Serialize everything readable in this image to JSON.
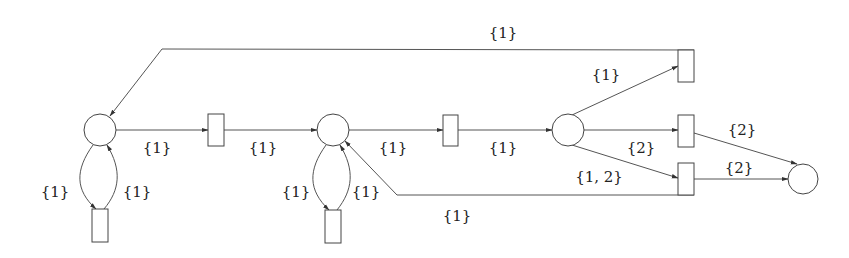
{
  "diagram": {
    "type": "petri-net",
    "places": [
      {
        "id": "p1",
        "cx": 100,
        "cy": 130,
        "r": 16
      },
      {
        "id": "p2",
        "cx": 333,
        "cy": 130,
        "r": 16
      },
      {
        "id": "p3",
        "cx": 568,
        "cy": 130,
        "r": 16
      },
      {
        "id": "p4",
        "cx": 803,
        "cy": 179,
        "r": 15
      }
    ],
    "transitions": [
      {
        "id": "t1",
        "x": 208,
        "y": 114,
        "w": 16,
        "h": 32
      },
      {
        "id": "t2",
        "x": 443,
        "y": 115,
        "w": 15,
        "h": 31
      },
      {
        "id": "t3",
        "x": 678,
        "y": 50,
        "w": 16,
        "h": 32
      },
      {
        "id": "t4",
        "x": 678,
        "y": 115,
        "w": 16,
        "h": 32
      },
      {
        "id": "t5",
        "x": 678,
        "y": 163,
        "w": 16,
        "h": 32
      },
      {
        "id": "t6",
        "x": 92,
        "y": 209,
        "w": 16,
        "h": 33
      },
      {
        "id": "t7",
        "x": 325,
        "y": 210,
        "w": 16,
        "h": 33
      }
    ],
    "labels": {
      "top_return": "{1}",
      "p1_t1": "{1}",
      "t1_p2": "{1}",
      "p2_t2": "{1}",
      "t2_p3": "{1}",
      "p3_t3": "{1}",
      "p3_t4": "{2}",
      "p3_t5": "{1, 2}",
      "t4_p4": "{2}",
      "t5_p4": "{2}",
      "p1_t6": "{1}",
      "t6_p1": "{1}",
      "p2_t7": "{1}",
      "t7_p2": "{1}",
      "bottom_return": "{1}"
    }
  }
}
